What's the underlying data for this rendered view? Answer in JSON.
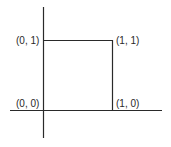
{
  "diagram": {
    "type": "unit-square-on-axes",
    "line_color": "#2a2a2a",
    "points": [
      {
        "id": "origin",
        "label": "(0, 0)"
      },
      {
        "id": "top-left",
        "label": "(0, 1)"
      },
      {
        "id": "top-right",
        "label": "(1, 1)"
      },
      {
        "id": "bottom-right",
        "label": "(1, 0)"
      }
    ]
  }
}
